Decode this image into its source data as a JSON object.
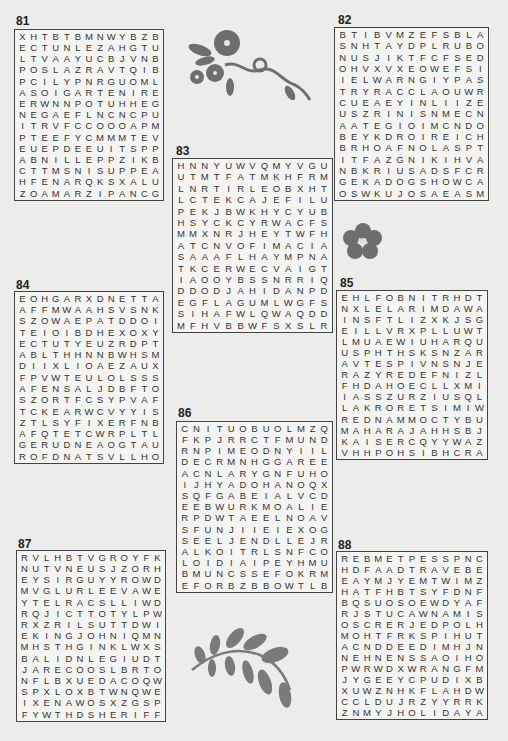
{
  "puzzles": [
    {
      "number": "81",
      "rows": [
        "XHTBTBMNWYBZB",
        "ECTUNLEZAHGTU",
        "LTVAAYUCBJVNB",
        "POSLAZRAVTQIB",
        "PCILYPNRGUOML",
        "ASOIGARTENIRE",
        "ERWNNPOTUHHEG",
        "NEGAEFLNCNCPU",
        "ITRVFCCOOOAPM",
        "PTEEFYCMMMTEV",
        "EUEPDEEUITSPP",
        "ABNILLEPPZIKB",
        "CTTMSNISUPPEA",
        "HFENARQKSXALU",
        "ZOAMARZIPANCG"
      ]
    },
    {
      "number": "82",
      "rows": [
        "BTIBVMZEFSBLA",
        "SNHTAYDPLRUBO",
        "NUSJIKTFCFSED",
        "OHVXVXEOWEFSI",
        "IELWARNGIYPAS",
        "TRYRACCLAOUWR",
        "CUEAEYINLIIZE",
        "USZRINISNMECN",
        "AATEGIOIMCNDO",
        "BEYKDROIREICH",
        "BRHOAFNOLASPT",
        "ITFAZGNIKIHVA",
        "NBKRIUSADSFCR",
        "GEKADOGSHOWCA",
        "OSWKUJOSAEASM"
      ]
    },
    {
      "number": "83",
      "rows": [
        "HNNYUWVQMYVGU",
        "UTMTFATMKHFRM",
        "LNRTIRLEOBXHT",
        "LCTEKCAJEFILU",
        "PEKJBWKHYCYUB",
        "HSYCKCYRWACFS",
        "MMXNRJHEYTWFH",
        "ATCNVOFIMACIA",
        "SAAAFLHAYMPNA",
        "TKCERWECVAIGT",
        "IAOOYBSSNRRIQ",
        "DDODJAHIDANPD",
        "EGFLAGUMLWGFS",
        "SIHAFWLQWAQDD",
        "MFHVBBWFSXSLR"
      ]
    },
    {
      "number": "84",
      "rows": [
        "EOHGARXDNETTA",
        "AFFMWAAHSVSNK",
        "SZOWAEPATDDOI",
        "TEIOIBDHEXOXY",
        "ECTUTYEUZRDPT",
        "ABLTHHNNBWHSM",
        "DIIXLIOAEZAUX",
        "FPVWTEULOLSSS",
        "AFENSALJDBFTO",
        "SZORTFCSYPVAF",
        "TCKEARWCVYYIS",
        "ZTLSYFIXERFNB",
        "AFQTETCWRPLTL",
        "GERUDNEAOGTAU",
        "ROFDNATSVLLHO"
      ]
    },
    {
      "number": "85",
      "rows": [
        "EHLFOBNITRHDT",
        "NXLELARIMDAWA",
        "INSFTLIZXKJSG",
        "EILLVRXPLLUWT",
        "LMUAEWIUHARQU",
        "USPHTHSKSNZAR",
        "AVTESPIVNSNJE",
        "RAZYREDEFNIZL",
        "FHDAHOECLLXMI",
        "IASSZURZIUSQL",
        "LAKRORETSIMIW",
        "REDNAMMOCTYBU",
        "MAHARAJAHHSBJ",
        "KAISERCQYYWAZ",
        "VHHPOHSIBHCRA"
      ]
    },
    {
      "number": "86",
      "rows": [
        "CNITUOBUOLMZQ",
        "FKPJRRCTFMUND",
        "RNPIMEODNYIIL",
        "DECRMNHGGAREE",
        "ACNLARYGNFUHO",
        "IJHYADOHANOQX",
        "SQFGABEIALVCD",
        "EEBWURKMOALIE",
        "RPDWTAEELNOAV",
        "SFUNJIIEIEXOG",
        "SEELJENDLLEJR",
        "ALKOITRLSNFCO",
        "LOIDIAIPEYHMU",
        "BMUNCSSEFOKRM",
        "EFORBZBBOWTLB"
      ]
    },
    {
      "number": "87",
      "rows": [
        "RVLHBTVGROYFK",
        "NUTVNEUSJZORH",
        "EYSIRGUYYROWD",
        "MVGLURLEEVAWE",
        "YTELRACSLLIWD",
        "RQJICTTOTYLPW",
        "RXZRILSUTTDWI",
        "EKINGJOHNIQMN",
        "MHSTHGINKLWXS",
        "BALIDNLEGIUDT",
        "JARECOOSLBRTO",
        "NFLBXUEDACOQW",
        "SPXLOXBTWNQWE",
        "IXENAWOSXZGSP",
        "FYWTHDSHERIFF"
      ]
    },
    {
      "number": "88",
      "rows": [
        "REBMETPESSPNC",
        "HDFAADTRAVEBE",
        "EAYMJYEMTWIMZ",
        "HATFHBTSYFDNF",
        "BQSUOSOEWDYAF",
        "RJSTUCAWNAMIS",
        "OSCRERJEDPOLH",
        "MOHTFRKSPIHUT",
        "ACNDDEEDIMHJN",
        "NEHNENSSAOIHO",
        "PWRWDXWRANGFM",
        "JYGEEYCPUDIXB",
        "XUWZNHKFLAHDW",
        "CCLDUJRZYYRRK",
        "ZNMYJHOLIDAYA"
      ]
    }
  ],
  "decorations": [
    {
      "name": "flower-vine-icon",
      "color": "#6e6e6e"
    },
    {
      "name": "hibiscus-flower-icon",
      "color": "#6e6e6e"
    },
    {
      "name": "leaf-branch-icon",
      "color": "#7a7a7a"
    }
  ]
}
